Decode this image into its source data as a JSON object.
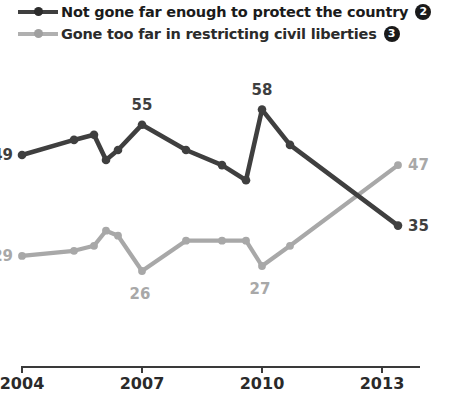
{
  "legend": {
    "items": [
      {
        "label": "Not gone far enough to protect the country",
        "badge": "2",
        "color": "#3f3f3f",
        "marker": "line-dot-marker"
      },
      {
        "label": "Gone too far in restricting civil liberties",
        "badge": "3",
        "color": "#a8a8a8",
        "marker": "line-dot-marker"
      }
    ]
  },
  "axis": {
    "ticks": [
      "2004",
      "2007",
      "2010",
      "2013"
    ]
  },
  "chart_data": {
    "type": "line",
    "title": "",
    "subtitle": "",
    "xlabel": "",
    "ylabel": "",
    "xlim": [
      2004,
      2013.6
    ],
    "ylim": [
      20,
      62
    ],
    "grid": false,
    "legend_position": "top-left",
    "x_ticks": [
      2004,
      2007,
      2010,
      2013
    ],
    "x_tick_labels": [
      "2004",
      "2007",
      "2010",
      "2013"
    ],
    "series": [
      {
        "name": "Not gone far enough to protect the country",
        "badge": "2",
        "color": "#3f3f3f",
        "x": [
          2004,
          2005.3,
          2005.8,
          2006.1,
          2006.4,
          2007,
          2008.1,
          2009.0,
          2009.6,
          2010.0,
          2010.7,
          2013.4
        ],
        "values": [
          49,
          52,
          53,
          48,
          50,
          55,
          50,
          47,
          44,
          58,
          51,
          35
        ],
        "point_labels": [
          {
            "x": 2004,
            "value": 49,
            "text": "49",
            "position": "left"
          },
          {
            "x": 2007,
            "value": 55,
            "text": "55",
            "position": "above"
          },
          {
            "x": 2010.0,
            "value": 58,
            "text": "58",
            "position": "above"
          },
          {
            "x": 2013.4,
            "value": 35,
            "text": "35",
            "position": "right"
          }
        ]
      },
      {
        "name": "Gone too far in restricting civil liberties",
        "badge": "3",
        "color": "#a8a8a8",
        "x": [
          2004,
          2005.3,
          2005.8,
          2006.1,
          2006.4,
          2007,
          2008.1,
          2009.0,
          2009.6,
          2010.0,
          2010.7,
          2013.4
        ],
        "values": [
          29,
          30,
          31,
          34,
          33,
          26,
          32,
          32,
          32,
          27,
          31,
          47
        ],
        "point_labels": [
          {
            "x": 2004,
            "value": 29,
            "text": "29",
            "position": "left"
          },
          {
            "x": 2007,
            "value": 26,
            "text": "26",
            "position": "below"
          },
          {
            "x": 2010.0,
            "value": 27,
            "text": "27",
            "position": "below"
          },
          {
            "x": 2013.4,
            "value": 47,
            "text": "47",
            "position": "right"
          }
        ]
      }
    ]
  },
  "labels": {
    "dark_start": "49",
    "dark_peak_2007": "55",
    "dark_peak_2010": "58",
    "dark_end": "35",
    "grey_start": "29",
    "grey_low_2007": "26",
    "grey_low_2010": "27",
    "grey_end": "47"
  },
  "colors": {
    "dark_series": "#3f3f3f",
    "grey_series": "#a8a8a8",
    "axis": "#3a3a3a",
    "badge_bg": "#1a1a1a",
    "badge_text": "#ffffff",
    "background": "#ffffff"
  }
}
